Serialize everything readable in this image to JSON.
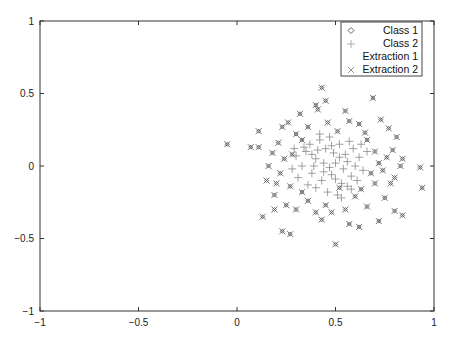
{
  "chart_data": {
    "type": "scatter",
    "title": "",
    "xlabel": "",
    "ylabel": "",
    "xlim": [
      -1,
      1
    ],
    "ylim": [
      -1,
      1
    ],
    "x_ticks": [
      -1,
      -0.5,
      0,
      0.5,
      1
    ],
    "x_tick_labels": [
      "-1",
      "-0.5",
      "0",
      "0.5",
      "1"
    ],
    "y_ticks": [
      -1,
      -0.5,
      0,
      0.5,
      1
    ],
    "y_tick_labels": [
      "-1",
      "-0.5",
      "0",
      "0.5",
      "1"
    ],
    "grid": false,
    "legend_position": "upper right",
    "colors": {
      "class1": "#555555",
      "class2": "#8a8a8a",
      "extraction2": "#666666",
      "axis": "#333333"
    },
    "series": [
      {
        "name": "Class 1",
        "marker": "diamond",
        "points": [
          [
            -0.05,
            0.15
          ],
          [
            0.07,
            0.13
          ],
          [
            0.11,
            0.13
          ],
          [
            0.11,
            0.24
          ],
          [
            0.93,
            -0.01
          ],
          [
            0.94,
            -0.15
          ],
          [
            0.43,
            0.54
          ],
          [
            0.5,
            -0.54
          ],
          [
            0.23,
            -0.45
          ],
          [
            0.27,
            -0.47
          ],
          [
            0.4,
            0.42
          ],
          [
            0.45,
            0.45
          ],
          [
            0.41,
            0.39
          ],
          [
            0.69,
            0.47
          ],
          [
            0.55,
            0.38
          ],
          [
            0.57,
            0.31
          ],
          [
            0.62,
            0.29
          ],
          [
            0.73,
            0.32
          ],
          [
            0.77,
            0.26
          ],
          [
            0.81,
            0.2
          ],
          [
            0.84,
            0.05
          ],
          [
            0.83,
            0.0
          ],
          [
            0.8,
            -0.08
          ],
          [
            0.78,
            -0.12
          ],
          [
            0.75,
            -0.22
          ],
          [
            0.8,
            -0.31
          ],
          [
            0.84,
            -0.34
          ],
          [
            0.72,
            -0.38
          ],
          [
            0.66,
            -0.28
          ],
          [
            0.6,
            -0.21
          ],
          [
            0.55,
            -0.3
          ],
          [
            0.48,
            -0.32
          ],
          [
            0.43,
            -0.37
          ],
          [
            0.4,
            -0.32
          ],
          [
            0.36,
            -0.24
          ],
          [
            0.3,
            -0.3
          ],
          [
            0.25,
            -0.27
          ],
          [
            0.19,
            -0.2
          ],
          [
            0.15,
            -0.1
          ],
          [
            0.13,
            -0.35
          ],
          [
            0.16,
            0.0
          ],
          [
            0.18,
            0.09
          ],
          [
            0.21,
            0.16
          ],
          [
            0.23,
            0.27
          ],
          [
            0.26,
            0.3
          ],
          [
            0.3,
            0.22
          ],
          [
            0.33,
            0.18
          ],
          [
            0.36,
            0.27
          ],
          [
            0.46,
            0.3
          ],
          [
            0.51,
            0.24
          ],
          [
            0.66,
            0.18
          ],
          [
            0.7,
            0.1
          ],
          [
            0.72,
            0.02
          ],
          [
            0.68,
            -0.05
          ],
          [
            0.7,
            -0.12
          ],
          [
            0.63,
            -0.16
          ],
          [
            0.22,
            -0.05
          ],
          [
            0.24,
            0.05
          ],
          [
            0.2,
            -0.12
          ],
          [
            0.27,
            -0.14
          ],
          [
            0.33,
            -0.18
          ],
          [
            0.57,
            -0.4
          ],
          [
            0.62,
            -0.42
          ],
          [
            0.74,
            -0.03
          ],
          [
            0.76,
            0.06
          ],
          [
            0.79,
            0.11
          ],
          [
            0.32,
            0.36
          ],
          [
            0.28,
            0.08
          ],
          [
            0.19,
            -0.3
          ],
          [
            0.45,
            -0.27
          ],
          [
            0.52,
            -0.15
          ],
          [
            0.65,
            0.23
          ]
        ]
      },
      {
        "name": "Class 2",
        "marker": "plus",
        "points": [
          [
            0.35,
            0.1
          ],
          [
            0.4,
            0.05
          ],
          [
            0.45,
            0.12
          ],
          [
            0.5,
            0.02
          ],
          [
            0.55,
            0.08
          ],
          [
            0.6,
            0.0
          ],
          [
            0.38,
            -0.05
          ],
          [
            0.43,
            -0.1
          ],
          [
            0.48,
            -0.06
          ],
          [
            0.53,
            -0.12
          ],
          [
            0.58,
            -0.07
          ],
          [
            0.62,
            0.06
          ],
          [
            0.33,
            0.0
          ],
          [
            0.37,
            0.15
          ],
          [
            0.42,
            0.18
          ],
          [
            0.47,
            0.2
          ],
          [
            0.52,
            0.15
          ],
          [
            0.57,
            0.17
          ],
          [
            0.4,
            -0.15
          ],
          [
            0.46,
            -0.18
          ],
          [
            0.51,
            -0.2
          ],
          [
            0.56,
            -0.14
          ],
          [
            0.3,
            0.07
          ],
          [
            0.31,
            -0.08
          ],
          [
            0.64,
            -0.03
          ],
          [
            0.66,
            0.1
          ],
          [
            0.44,
            0.02
          ],
          [
            0.49,
            0.09
          ],
          [
            0.54,
            -0.02
          ],
          [
            0.36,
            -0.13
          ],
          [
            0.41,
            0.11
          ],
          [
            0.59,
            0.12
          ],
          [
            0.47,
            -0.01
          ],
          [
            0.52,
            0.06
          ],
          [
            0.39,
            0.0
          ],
          [
            0.61,
            -0.1
          ],
          [
            0.34,
            0.13
          ],
          [
            0.44,
            -0.04
          ],
          [
            0.5,
            -0.09
          ],
          [
            0.56,
            0.03
          ],
          [
            0.28,
            -0.02
          ],
          [
            0.29,
            0.12
          ],
          [
            0.63,
            0.15
          ],
          [
            0.42,
            0.22
          ],
          [
            0.53,
            -0.22
          ],
          [
            0.38,
            0.08
          ],
          [
            0.48,
            0.14
          ],
          [
            0.58,
            -0.16
          ]
        ]
      },
      {
        "name": "Extraction 1",
        "marker": "none",
        "points": []
      },
      {
        "name": "Extraction 2",
        "marker": "x",
        "points": "same as Class 1 (overlaid)"
      }
    ]
  },
  "legend": {
    "items": [
      {
        "label": "Class 1",
        "marker": "diamond"
      },
      {
        "label": "Class 2",
        "marker": "plus"
      },
      {
        "label": "Extraction 1",
        "marker": "none"
      },
      {
        "label": "Extraction 2",
        "marker": "x"
      }
    ]
  }
}
